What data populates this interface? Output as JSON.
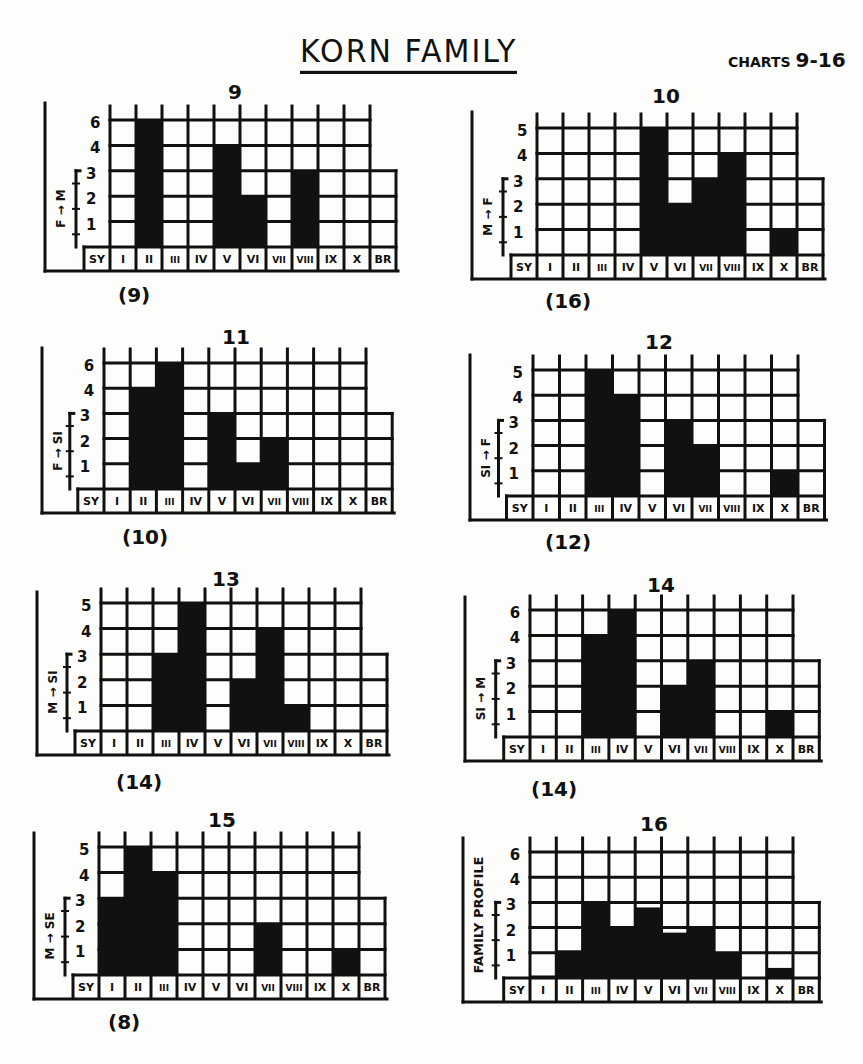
{
  "header": {
    "title": "KORN FAMILY",
    "subtitle_prefix": "CHARTS",
    "subtitle_range": "9-16"
  },
  "chart_data": [
    {
      "id": "9",
      "type": "bar",
      "title": "9",
      "ylabel": "F → M",
      "count": "(9)",
      "categories": [
        "SY",
        "I",
        "II",
        "III",
        "IV",
        "V",
        "VI",
        "VII",
        "VIII",
        "IX",
        "X",
        "BR"
      ],
      "ytick_labels": [
        "1",
        "2",
        "3",
        "4",
        "6"
      ],
      "values": [
        0,
        0,
        5,
        0,
        0,
        4,
        2,
        0,
        3,
        0,
        0,
        0
      ],
      "ylim": [
        0,
        5
      ],
      "layout": {
        "x": 45,
        "y": 103,
        "gridLeft": 110,
        "gridTop": 120,
        "colW": 26,
        "rowH": 25.4,
        "labelH": 22,
        "titleX": 228,
        "titleY": 80,
        "countX": 118,
        "countY": 283
      }
    },
    {
      "id": "10",
      "type": "bar",
      "title": "10",
      "ylabel": "M → F",
      "count": "(16)",
      "categories": [
        "SY",
        "I",
        "II",
        "III",
        "IV",
        "V",
        "VI",
        "VII",
        "VIII",
        "IX",
        "X",
        "BR"
      ],
      "ytick_labels": [
        "1",
        "2",
        "3",
        "4",
        "5"
      ],
      "values": [
        0,
        0,
        0,
        0,
        0,
        5,
        2,
        3,
        4,
        0,
        1,
        0
      ],
      "ylim": [
        0,
        5
      ],
      "layout": {
        "x": 472,
        "y": 112,
        "gridLeft": 537,
        "gridTop": 128,
        "colW": 26,
        "rowH": 25.4,
        "labelH": 22,
        "titleX": 652,
        "titleY": 84,
        "countX": 545,
        "countY": 289
      }
    },
    {
      "id": "11",
      "type": "bar",
      "title": "11",
      "ylabel": "F → SI",
      "count": "(10)",
      "categories": [
        "SY",
        "I",
        "II",
        "III",
        "IV",
        "V",
        "VI",
        "VII",
        "VIII",
        "IX",
        "X",
        "BR"
      ],
      "ytick_labels": [
        "1",
        "2",
        "3",
        "4",
        "6"
      ],
      "values": [
        0,
        0,
        4,
        5,
        0,
        3,
        1,
        2,
        0,
        0,
        0,
        0
      ],
      "ylim": [
        0,
        5
      ],
      "layout": {
        "x": 42,
        "y": 348,
        "gridLeft": 104,
        "gridTop": 363,
        "colW": 26.2,
        "rowH": 25.2,
        "labelH": 22,
        "titleX": 222,
        "titleY": 325,
        "countX": 122,
        "countY": 525
      }
    },
    {
      "id": "12",
      "type": "bar",
      "title": "12",
      "ylabel": "SI → F",
      "count": "(12)",
      "categories": [
        "SY",
        "I",
        "II",
        "III",
        "IV",
        "V",
        "VI",
        "VII",
        "VIII",
        "IX",
        "X",
        "BR"
      ],
      "ytick_labels": [
        "1",
        "2",
        "3",
        "4",
        "5"
      ],
      "values": [
        0,
        0,
        0,
        5,
        4,
        0,
        3,
        2,
        0,
        0,
        1,
        0
      ],
      "ylim": [
        0,
        5
      ],
      "layout": {
        "x": 470,
        "y": 355,
        "gridLeft": 533,
        "gridTop": 370,
        "colW": 26.5,
        "rowH": 25.2,
        "labelH": 22,
        "titleX": 645,
        "titleY": 330,
        "countX": 545,
        "countY": 530
      }
    },
    {
      "id": "13",
      "type": "bar",
      "title": "13",
      "ylabel": "M → SI",
      "count": "(14)",
      "categories": [
        "SY",
        "I",
        "II",
        "III",
        "IV",
        "V",
        "VI",
        "VII",
        "VIII",
        "IX",
        "X",
        "BR"
      ],
      "ytick_labels": [
        "1",
        "2",
        "3",
        "4",
        "5"
      ],
      "values": [
        0,
        0,
        0,
        3,
        5,
        0,
        2,
        4,
        1,
        0,
        0,
        0
      ],
      "ylim": [
        0,
        5
      ],
      "layout": {
        "x": 37,
        "y": 592,
        "gridLeft": 101,
        "gridTop": 603,
        "colW": 26,
        "rowH": 25.6,
        "labelH": 22,
        "titleX": 212,
        "titleY": 567,
        "countX": 116,
        "countY": 770
      }
    },
    {
      "id": "14",
      "type": "bar",
      "title": "14",
      "ylabel": "SI → M",
      "count": "(14)",
      "categories": [
        "SY",
        "I",
        "II",
        "III",
        "IV",
        "V",
        "VI",
        "VII",
        "VIII",
        "IX",
        "X",
        "BR"
      ],
      "ytick_labels": [
        "1",
        "2",
        "3",
        "4",
        "6"
      ],
      "values": [
        0,
        0,
        0,
        4,
        5,
        0,
        2,
        3,
        0,
        0,
        1,
        0
      ],
      "ylim": [
        0,
        5
      ],
      "layout": {
        "x": 465,
        "y": 597,
        "gridLeft": 530,
        "gridTop": 610,
        "colW": 26.3,
        "rowH": 25.4,
        "labelH": 22,
        "titleX": 647,
        "titleY": 573,
        "countX": 531,
        "countY": 777
      }
    },
    {
      "id": "15",
      "type": "bar",
      "title": "15",
      "ylabel": "M → SE",
      "count": "(8)",
      "categories": [
        "SY",
        "I",
        "II",
        "III",
        "IV",
        "V",
        "VI",
        "VII",
        "VIII",
        "IX",
        "X",
        "BR"
      ],
      "ytick_labels": [
        "1",
        "2",
        "3",
        "4",
        "5"
      ],
      "values": [
        0,
        3,
        5,
        4,
        0,
        0,
        0,
        2,
        0,
        0,
        1,
        0
      ],
      "ylim": [
        0,
        5
      ],
      "layout": {
        "x": 34,
        "y": 833,
        "gridLeft": 99,
        "gridTop": 847,
        "colW": 26,
        "rowH": 25.6,
        "labelH": 22,
        "titleX": 208,
        "titleY": 808,
        "countX": 108,
        "countY": 1010
      }
    },
    {
      "id": "16",
      "type": "bar",
      "title": "16",
      "ylabel": "FAMILY PROFILE",
      "count": "",
      "categories": [
        "SY",
        "I",
        "II",
        "III",
        "IV",
        "V",
        "VI",
        "VII",
        "VIII",
        "IX",
        "X",
        "BR"
      ],
      "ytick_labels": [
        "1",
        "2",
        "3",
        "4",
        "6"
      ],
      "values": [
        0,
        0.1,
        1.1,
        3.0,
        2.0,
        2.8,
        1.8,
        2.0,
        1.0,
        0,
        0.4,
        0
      ],
      "ylim": [
        0,
        5
      ],
      "layout": {
        "x": 463,
        "y": 838,
        "gridLeft": 530,
        "gridTop": 852,
        "colW": 26.3,
        "rowH": 25.2,
        "labelH": 22,
        "titleX": 640,
        "titleY": 812,
        "countX": 0,
        "countY": 0
      }
    }
  ]
}
